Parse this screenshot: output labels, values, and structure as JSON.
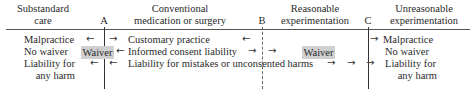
{
  "headers": {
    "col1": [
      "Substandard",
      "care"
    ],
    "A": "A",
    "col2": [
      "Conventional",
      "medication or surgery"
    ],
    "B": "B",
    "col3": [
      "Reasonable",
      "experimentation"
    ],
    "C": "C",
    "col4": [
      "Unreasonable",
      "experimentation"
    ]
  },
  "left": {
    "line1": "Malpractice",
    "line2": "No waiver",
    "line3": "Liability for",
    "line4": "any harm"
  },
  "middle": {
    "customary": "Customary practice",
    "informed": "Informed consent liability",
    "mistakes": "Liability for mistakes or unconsented harms"
  },
  "waiver_left": "Waiver",
  "waiver_right": "Waiver",
  "right": {
    "line1": "Malpractice",
    "line2": "No waiver",
    "line3": "Liability for",
    "line4": "any harm"
  },
  "arrows": {
    "left": "←",
    "right": "→"
  }
}
